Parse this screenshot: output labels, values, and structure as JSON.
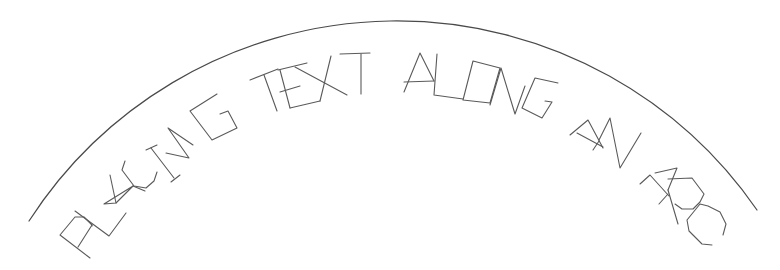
{
  "drawing": {
    "text": "PLACING TEXT ALONG AN ARC",
    "words": [
      "PLACING",
      "TEXT",
      "ALONG",
      "AN",
      "ARC"
    ],
    "stroke_color": "#5a5a5a",
    "background_color": "#ffffff",
    "arc": {
      "start": [
        29,
        221
      ],
      "apex": [
        392,
        21
      ],
      "end": [
        757,
        210
      ]
    },
    "letters": [
      {
        "char": "P",
        "word": "PLACING",
        "strokes": [
          "M90,258 L60,235 L75,217 L84,217 L92,225 L78,247",
          "M92,225 L92,226"
        ]
      },
      {
        "char": "L",
        "word": "PLACING",
        "strokes": [
          "M75,211 L109,236 L126,213"
        ]
      },
      {
        "char": "A",
        "word": "PLACING",
        "strokes": [
          "M104,204 L133,186 L116,203 L104,204",
          "M110,175 L116,203",
          "M133,186 L145,191"
        ]
      },
      {
        "char": "C",
        "word": "PLACING",
        "strokes": [
          "M125,161 L122,170 L134,186 L146,188 L154,181 L157,172"
        ]
      },
      {
        "char": "I",
        "word": "PLACING",
        "strokes": [
          "M151,148 L174,178",
          "M146,150 L157,145",
          "M171,182 L180,175"
        ]
      },
      {
        "char": "N",
        "word": "PLACING",
        "strokes": [
          "M166,153 L189,158 L168,128 L193,145"
        ]
      },
      {
        "char": "G",
        "word": "PLACING",
        "strokes": [
          "M217,94 L190,111 L212,140 L237,128 L228,111 L220,114"
        ]
      },
      {
        "char": "T",
        "word": "TEXT",
        "strokes": [
          "M250,80 L278,69",
          "M264,75 L277,111"
        ]
      },
      {
        "char": "E",
        "word": "TEXT",
        "strokes": [
          "M278,70 L307,63",
          "M280,92 L300,86",
          "M290,108 L320,101",
          "M280,70 L290,108"
        ]
      },
      {
        "char": "X",
        "word": "TEXT",
        "strokes": [
          "M295,67 L347,95",
          "M331,56 L320,101"
        ]
      },
      {
        "char": "T",
        "word": "TEXT",
        "strokes": [
          "M340,54 L370,53",
          "M361,54 L361,94"
        ]
      },
      {
        "char": "A",
        "word": "ALONG",
        "strokes": [
          "M404,92 L420,53 L434,81",
          "M404,82 L434,81"
        ]
      },
      {
        "char": "L",
        "word": "ALONG",
        "strokes": [
          "M437,54 L434,95 L463,99"
        ]
      },
      {
        "char": "O",
        "word": "ALONG",
        "strokes": [
          "M463,100 L490,103 L500,68 L473,61 L463,100"
        ]
      },
      {
        "char": "N",
        "word": "ALONG",
        "strokes": [
          "M490,105 L501,68 L515,114 L525,86"
        ]
      },
      {
        "char": "G",
        "word": "ALONG",
        "strokes": [
          "M558,83 L535,78 L522,108 L542,118 L552,102 L545,101"
        ]
      },
      {
        "char": "A",
        "word": "AN",
        "strokes": [
          "M570,135 L588,120 L603,148",
          "M577,133 L603,147",
          "M593,150 L599,141"
        ]
      },
      {
        "char": "N",
        "word": "AN",
        "strokes": [
          "M599,140 L610,118 L620,168 L641,133"
        ]
      },
      {
        "char": "A",
        "word": "ARC",
        "strokes": [
          "M640,184 L650,175 L669,196",
          "M655,173 L677,168 L668,190",
          "M659,204 L668,194"
        ]
      },
      {
        "char": "R",
        "word": "ARC",
        "strokes": [
          "M668,190 L678,224",
          "M668,179 L692,178 L704,194 L700,202 L693,209 L682,209 L675,204"
        ]
      },
      {
        "char": "C",
        "word": "ARC",
        "strokes": [
          "M712,245 L702,244 L689,231 L687,220 L700,204 L708,206 L720,212 L726,224 L723,235"
        ]
      }
    ]
  }
}
